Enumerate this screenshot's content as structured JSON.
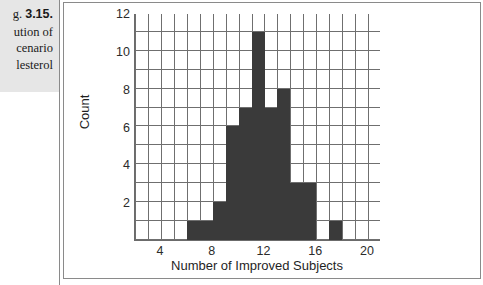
{
  "caption": {
    "figure_label_prefix": "g.",
    "figure_number": "3.15.",
    "line1": "ution of",
    "line2": "cenario",
    "line3": "lesterol"
  },
  "chart_data": {
    "type": "bar",
    "title": "",
    "subtitle": "",
    "xlabel": "Number of Improved Subjects",
    "ylabel": "Count",
    "xlim": [
      2,
      21
    ],
    "ylim": [
      0,
      12
    ],
    "xticks": [
      4,
      8,
      12,
      16,
      20
    ],
    "yticks": [
      2,
      4,
      6,
      8,
      10,
      12
    ],
    "xtick_labels": [
      "4",
      "8",
      "12",
      "16",
      "20"
    ],
    "ytick_labels": [
      "2",
      "4",
      "6",
      "8",
      "10",
      "12"
    ],
    "grid": true,
    "grid_x_step": 1,
    "grid_y_step": 1,
    "legend": "none",
    "bin_width": 1,
    "bar_color": "#3a3a3a",
    "categories": [
      6,
      7,
      8,
      9,
      10,
      11,
      12,
      13,
      14,
      15,
      17
    ],
    "values": [
      1,
      1,
      2,
      6,
      7,
      11,
      7,
      8,
      3,
      3,
      1
    ],
    "bars": [
      {
        "x": 6,
        "count": 1
      },
      {
        "x": 7,
        "count": 1
      },
      {
        "x": 8,
        "count": 2
      },
      {
        "x": 9,
        "count": 6
      },
      {
        "x": 10,
        "count": 7
      },
      {
        "x": 11,
        "count": 11
      },
      {
        "x": 12,
        "count": 7
      },
      {
        "x": 13,
        "count": 8
      },
      {
        "x": 14,
        "count": 3
      },
      {
        "x": 15,
        "count": 3
      },
      {
        "x": 17,
        "count": 1
      }
    ]
  }
}
